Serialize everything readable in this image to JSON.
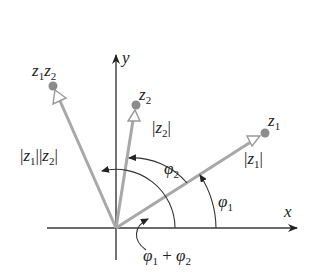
{
  "diagram": {
    "axes": {
      "x_label": "x",
      "y_label": "y"
    },
    "colors": {
      "vector": "#a8a8a8",
      "dot": "#8c8c8c",
      "axis": "#3a3a3a",
      "arc": "#333333"
    },
    "origin": [
      116,
      228
    ],
    "vectors": [
      {
        "name": "z1",
        "label": "z",
        "sub": "1",
        "modulus_label": "|z1|",
        "tip": [
          265,
          133
        ]
      },
      {
        "name": "z2",
        "label": "z",
        "sub": "2",
        "modulus_label": "|z2|",
        "tip": [
          136,
          105
        ]
      },
      {
        "name": "z1z2",
        "label": "z1z2",
        "modulus_label": "|z1||z2|",
        "tip": [
          53,
          86
        ]
      }
    ],
    "angles": [
      {
        "name": "phi1",
        "label": "φ1"
      },
      {
        "name": "phi2",
        "label": "φ2"
      },
      {
        "name": "phi1_plus_phi2",
        "label": "φ1 + φ2"
      }
    ]
  }
}
